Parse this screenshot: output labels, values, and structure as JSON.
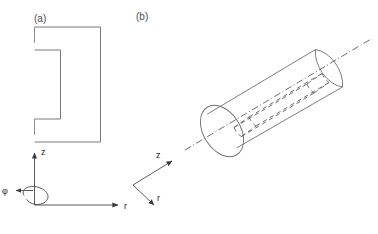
{
  "figure": {
    "background_color": "#ffffff",
    "line_color": "#7a7a7a",
    "text_color": "#3a3a3a"
  },
  "panels": [
    {
      "id": "a",
      "label": "(a)",
      "description": "Meridional cross-section: rectangular profile with a re-entrant notch on the inner (axis) side; dashed segments mark the symmetry axis boundary",
      "shape": {
        "type": "notched-rectangle",
        "outer_width_px": 66,
        "outer_height_px": 128,
        "notch_depth_px": 26,
        "notch_height_px": 57
      },
      "axes": {
        "type": "cylindrical",
        "origin_label": "",
        "vertical_axis_label": "z",
        "horizontal_axis_label": "r",
        "azimuthal_axis_label": "φ"
      }
    },
    {
      "id": "b",
      "label": "(b)",
      "description": "Three-dimensional view: cylinder with dash-dot symmetry axis and hidden (dashed) internal annular groove",
      "shape": {
        "type": "cylinder",
        "orientation": "oblique, axis rising to upper-right",
        "axis_line_style": "dash-dot",
        "hidden_feature": "internal annular notch drawn with dashed lines"
      },
      "axes": {
        "type": "cylindrical",
        "axial_axis_label": "z",
        "radial_axis_label": "r"
      }
    }
  ],
  "labels": {
    "panel_a": "(a)",
    "panel_b": "(b)",
    "z_a": "z",
    "r_a": "r",
    "phi_a": "φ",
    "z_b": "z",
    "r_b": "r"
  }
}
